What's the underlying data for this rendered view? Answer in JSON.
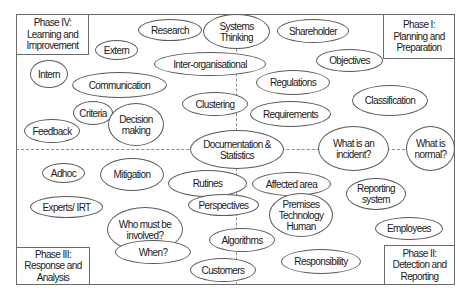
{
  "diagram": {
    "phases": {
      "phase1": {
        "title": "Phase I:",
        "line2": "Planning and",
        "line3": "Preparation"
      },
      "phase2": {
        "title": "Phase II:",
        "line2": "Detection and",
        "line3": "Reporting"
      },
      "phase3": {
        "title": "Phase III:",
        "line2": "Response and",
        "line3": "Analysis"
      },
      "phase4": {
        "title": "Phase IV:",
        "line2": "Learning and",
        "line3": "Improvement"
      }
    },
    "nodes": {
      "research": {
        "label": "Research"
      },
      "systems_thinking": {
        "line1": "Systems",
        "line2": "Thinking"
      },
      "shareholder": {
        "label": "Shareholder"
      },
      "extern": {
        "label": "Extern"
      },
      "intern": {
        "label": "Intern"
      },
      "inter_organisational": {
        "label": "Inter-organisational"
      },
      "objectives": {
        "label": "Objectives"
      },
      "communication": {
        "label": "Communication"
      },
      "regulations": {
        "label": "Regulations"
      },
      "criteria": {
        "label": "Criteria"
      },
      "decision_making": {
        "line1": "Decision",
        "line2": "making"
      },
      "clustering": {
        "label": "Clustering"
      },
      "requirements": {
        "label": "Requirements"
      },
      "classification": {
        "label": "Classification"
      },
      "feedback": {
        "label": "Feedback"
      },
      "documentation_statistics": {
        "line1": "Documentation &",
        "line2": "Statistics"
      },
      "what_is_an_incident": {
        "line1": "What is an",
        "line2": "incident?"
      },
      "what_is_normal": {
        "line1": "What is",
        "line2": "normal?"
      },
      "adhoc": {
        "label": "Adhoc"
      },
      "mitigation": {
        "label": "Mitigation"
      },
      "rutines": {
        "label": "Rutines"
      },
      "affected_area": {
        "label": "Affected area"
      },
      "perspectives": {
        "label": "Perspectives"
      },
      "premises_technology_human": {
        "line1": "Premises",
        "line2": "Technology",
        "line3": "Human"
      },
      "reporting_system": {
        "line1": "Reporting",
        "line2": "system"
      },
      "experts_irt": {
        "label": "Experts/ IRT"
      },
      "who_must_be_involved": {
        "line1": "Who must be",
        "line2": "involved?"
      },
      "algorithms": {
        "label": "Algorithms"
      },
      "employees": {
        "label": "Employees"
      },
      "when": {
        "label": "When?"
      },
      "customers": {
        "label": "Customers"
      },
      "responsibility": {
        "label": "Responsibility"
      }
    },
    "colors": {
      "line": "#6b6b6b",
      "dash": "#8a8a8a",
      "text": "#1a1a1a",
      "background": "#ffffff"
    }
  }
}
